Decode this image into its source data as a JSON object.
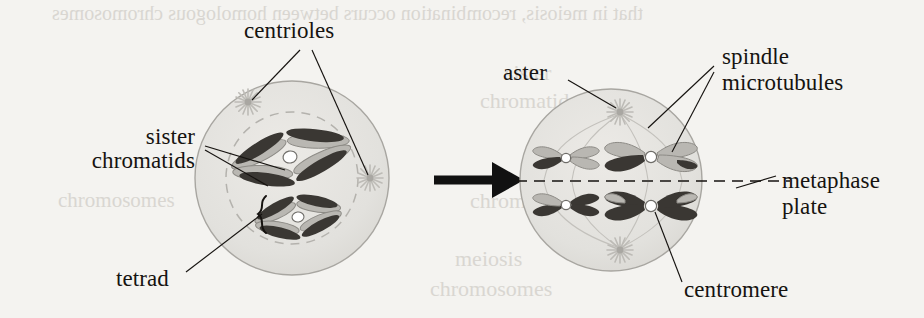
{
  "figure": {
    "background_color": "#f4f3f0",
    "ink_color": "#161310",
    "cell_fill": "#e2e1dd",
    "cell_stroke": "#a8a6a1",
    "chromosome_dark": "#3a3733",
    "chromosome_light": "#b9b7b2",
    "centromere_color": "#ffffff",
    "aster_color": "#bdbbb6"
  },
  "labels": {
    "centrioles": "centrioles",
    "sister_chromatids_line1": "sister",
    "sister_chromatids_line2": "chromatids",
    "tetrad": "tetrad",
    "aster": "aster",
    "spindle_line1": "spindle",
    "spindle_line2": "microtubules",
    "metaphase_line1": "metaphase",
    "metaphase_line2": "plate",
    "centromere": "centromere"
  },
  "panels": {
    "left": {
      "name": "prophase-I-cell",
      "cx": 292,
      "cy": 178,
      "r": 97,
      "nucleus_r": 66,
      "asters": [
        {
          "x": 248,
          "y": 102
        },
        {
          "x": 370,
          "y": 178
        }
      ],
      "tetrads": 2
    },
    "right": {
      "name": "metaphase-I-cell",
      "cx": 611,
      "cy": 180,
      "r": 91,
      "asters": [
        {
          "x": 620,
          "y": 112
        },
        {
          "x": 620,
          "y": 250
        }
      ],
      "chromosome_pairs": 4,
      "metaphase_plate_y": 181
    }
  },
  "arrow": {
    "x1": 436,
    "y1": 180,
    "x2": 512,
    "y2": 180,
    "label": "transition-arrow"
  },
  "ghost_text": {
    "top": "that in meiosis, recombination occurs between homologous chromosomes",
    "mid_a": "sister",
    "mid_b": "chromatids",
    "mid_c": "chromosomes",
    "low_a": "meiosis",
    "low_b": "chromosomes"
  }
}
